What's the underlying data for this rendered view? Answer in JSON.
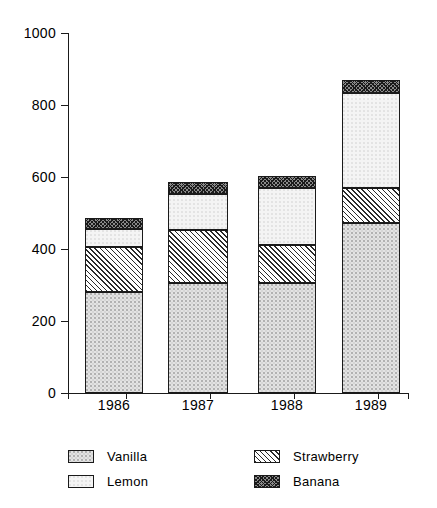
{
  "chart_data": {
    "type": "bar",
    "subtype": "stacked-bar",
    "title": "",
    "xlabel": "",
    "ylabel": "",
    "categories": [
      "1986",
      "1987",
      "1988",
      "1989"
    ],
    "series": [
      {
        "name": "Vanilla",
        "values": [
          280,
          306,
          306,
          472
        ]
      },
      {
        "name": "Strawberry",
        "values": [
          125,
          147,
          105,
          97
        ]
      },
      {
        "name": "Lemon",
        "values": [
          51,
          100,
          158,
          264
        ]
      },
      {
        "name": "Banana",
        "values": [
          29,
          33,
          34,
          36
        ]
      }
    ],
    "totals": [
      485,
      586,
      603,
      869
    ],
    "ylim": [
      0,
      1000
    ],
    "yticks": [
      0,
      200,
      400,
      600,
      800,
      1000
    ],
    "ytick_labels": [
      "0",
      "200",
      "400",
      "600",
      "800",
      "1000"
    ],
    "grid": false,
    "legend_position": "bottom"
  },
  "axis": {
    "y_labels": [
      "1000",
      "800",
      "600",
      "400",
      "200",
      "0"
    ],
    "y_values": [
      1000,
      800,
      600,
      400,
      200,
      0
    ],
    "x_labels": [
      "1986",
      "1987",
      "1988",
      "1989"
    ]
  },
  "legend": {
    "items": [
      {
        "label": "Vanilla",
        "swatch": "vanilla-swatch",
        "pattern": "light-stipple",
        "color": "#e3e3e3"
      },
      {
        "label": "Strawberry",
        "swatch": "strawberry-swatch",
        "pattern": "diagonal-hatch",
        "color": "#ffffff"
      },
      {
        "label": "Lemon",
        "swatch": "lemon-swatch",
        "pattern": "very-light-stipple",
        "color": "#f4f4f4"
      },
      {
        "label": "Banana",
        "swatch": "banana-swatch",
        "pattern": "dense-crosshatch",
        "color": "#8a8a8a"
      }
    ]
  }
}
